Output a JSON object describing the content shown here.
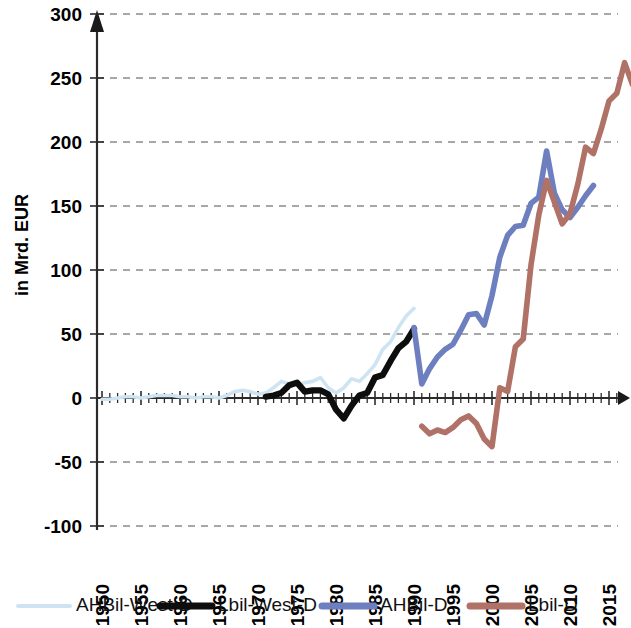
{
  "chart_data": {
    "type": "line",
    "title": "",
    "subtitle": "",
    "xlabel": "",
    "ylabel": "in Mrd. EUR",
    "xlim": [
      1950,
      2019
    ],
    "ylim": [
      -100,
      300
    ],
    "ytick_labels": [
      "300",
      "250",
      "200",
      "150",
      "100",
      "50",
      "0",
      "-50",
      "-100"
    ],
    "ytick_values": [
      300,
      250,
      200,
      150,
      100,
      50,
      0,
      -50,
      -100
    ],
    "xtick_labels": [
      "1950",
      "1955",
      "1960",
      "1965",
      "1970",
      "1975",
      "1980",
      "1985",
      "1990",
      "1995",
      "2000",
      "2005",
      "2010",
      "2015"
    ],
    "xtick_values": [
      1950,
      1955,
      1960,
      1965,
      1970,
      1975,
      1980,
      1985,
      1990,
      1995,
      2000,
      2005,
      2010,
      2015
    ],
    "grid": "horizontal-dashed",
    "legend_position": "bottom",
    "x_minor_ticks": "yearly",
    "colors": {
      "ahbil_west_d": "#cfe4f3",
      "lbil_west_d": "#0d0d0d",
      "ahbil_d": "#6e7fc0",
      "lbil_d": "#b07167",
      "grid": "#8a8a8a",
      "axis": "#2b2b2b"
    },
    "series": [
      {
        "name": "AHBil-West-D",
        "color": "#cfe4f3",
        "x": [
          1950,
          1951,
          1952,
          1953,
          1954,
          1955,
          1956,
          1957,
          1958,
          1959,
          1960,
          1961,
          1962,
          1963,
          1964,
          1965,
          1966,
          1967,
          1968,
          1969,
          1970,
          1971,
          1972,
          1973,
          1974,
          1975,
          1976,
          1977,
          1978,
          1979,
          1980,
          1981,
          1982,
          1983,
          1984,
          1985,
          1986,
          1987,
          1988,
          1989,
          1990
        ],
        "y": [
          -1,
          -1,
          0,
          1,
          1,
          0,
          1,
          2,
          2,
          2,
          1,
          1,
          0,
          1,
          1,
          0,
          2,
          5,
          6,
          5,
          3,
          4,
          8,
          13,
          11,
          10,
          12,
          13,
          16,
          8,
          4,
          8,
          15,
          13,
          19,
          26,
          38,
          44,
          55,
          64,
          70
        ]
      },
      {
        "name": "Lbil-West-D",
        "color": "#0d0d0d",
        "x": [
          1971,
          1972,
          1973,
          1974,
          1975,
          1976,
          1977,
          1978,
          1979,
          1980,
          1981,
          1982,
          1983,
          1984,
          1985,
          1986,
          1987,
          1988,
          1989,
          1990
        ],
        "y": [
          1,
          2,
          4,
          10,
          12,
          5,
          6,
          6,
          3,
          -9,
          -16,
          -6,
          2,
          4,
          16,
          18,
          29,
          39,
          44,
          54
        ]
      },
      {
        "name": "AHBil-D",
        "color": "#6e7fc0",
        "x": [
          1990,
          1991,
          1992,
          1993,
          1994,
          1995,
          1996,
          1997,
          1998,
          1999,
          2000,
          2001,
          2002,
          2003,
          2004,
          2005,
          2006,
          2007,
          2008,
          2009,
          2010,
          2011,
          2012,
          2013
        ],
        "y": [
          55,
          11,
          23,
          32,
          38,
          42,
          53,
          65,
          66,
          57,
          80,
          110,
          127,
          134,
          135,
          152,
          157,
          193,
          160,
          147,
          141,
          149,
          158,
          166
        ]
      },
      {
        "name": "Lbil-D",
        "color": "#b07167",
        "x": [
          1991,
          1992,
          1993,
          1994,
          1995,
          1996,
          1997,
          1998,
          1999,
          2000,
          2001,
          2002,
          2003,
          2004,
          2005,
          2006,
          2007,
          2008,
          2009,
          2010,
          2011,
          2012,
          2013,
          2014,
          2015,
          2016,
          2017,
          2018
        ],
        "y": [
          -22,
          -28,
          -25,
          -27,
          -23,
          -17,
          -14,
          -20,
          -32,
          -38,
          8,
          5,
          40,
          46,
          104,
          143,
          170,
          153,
          136,
          144,
          167,
          196,
          191,
          210,
          232,
          238,
          262,
          245
        ]
      }
    ],
    "legend": [
      {
        "label": "AHBil-West-D",
        "color": "#cfe4f3",
        "width": 4
      },
      {
        "label": "Lbil-West-D",
        "color": "#0d0d0d",
        "width": 7
      },
      {
        "label": "AHBil-D",
        "color": "#6e7fc0",
        "width": 7
      },
      {
        "label": "Lbil-D",
        "color": "#b07167",
        "width": 7
      }
    ]
  }
}
